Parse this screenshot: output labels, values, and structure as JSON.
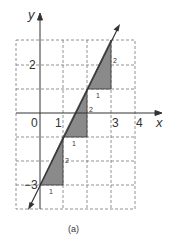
{
  "figure": {
    "caption": "(a)",
    "axes": {
      "x_label": "x",
      "y_label": "y",
      "x_ticks": [
        {
          "value": 0,
          "label": "0"
        },
        {
          "value": 1,
          "label": "1"
        },
        {
          "value": 3,
          "label": "3"
        },
        {
          "value": 4,
          "label": "4"
        }
      ],
      "y_ticks": [
        {
          "value": 2,
          "label": "2"
        },
        {
          "value": -3,
          "label": "−3"
        }
      ],
      "grid": {
        "x_range": [
          -1,
          4
        ],
        "y_range": [
          -4,
          3
        ],
        "style": "dashed"
      }
    },
    "line": {
      "equation": "y = 2x - 3",
      "slope": 2,
      "intercept": -3
    },
    "slope_triangles": [
      {
        "run_label": "1",
        "rise_label": "2",
        "from": [
          0,
          -3
        ],
        "to": [
          1,
          -1
        ]
      },
      {
        "run_label": "1",
        "rise_label": "2",
        "from": [
          1,
          -1
        ],
        "to": [
          2,
          1
        ]
      },
      {
        "run_label": "1",
        "rise_label": "2",
        "from": [
          2,
          1
        ],
        "to": [
          3,
          3
        ]
      }
    ],
    "colors": {
      "fill": "#8a8a8a",
      "line": "#333333",
      "grid": "#777777"
    }
  }
}
